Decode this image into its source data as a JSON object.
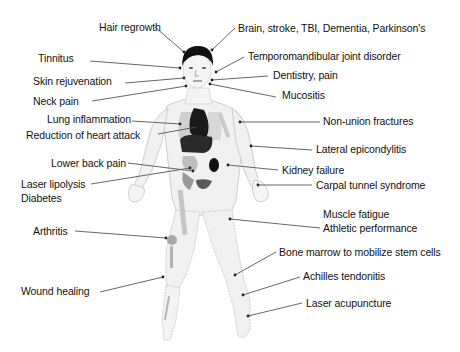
{
  "diagram": {
    "labels": [
      {
        "id": "hair-regrowth",
        "text": "Hair regrowth",
        "x": 99,
        "y": 21,
        "line": [
          155,
          27,
          184,
          52
        ]
      },
      {
        "id": "brain",
        "text": "Brain, stroke, TBI, Dementia, Parkinson's",
        "x": 238,
        "y": 22,
        "line": [
          235,
          28,
          212,
          50
        ]
      },
      {
        "id": "tinnitus",
        "text": "Tinnitus",
        "x": 38,
        "y": 52,
        "line": [
          90,
          61,
          180,
          68
        ]
      },
      {
        "id": "tmj",
        "text": "Temporomandibular joint disorder",
        "x": 248,
        "y": 50,
        "line": [
          244,
          57,
          216,
          72
        ]
      },
      {
        "id": "skin-rejuvenation",
        "text": "Skin rejuvenation",
        "x": 33,
        "y": 75,
        "line": [
          125,
          83,
          184,
          78
        ]
      },
      {
        "id": "dentistry",
        "text": "Dentistry, pain",
        "x": 273,
        "y": 69,
        "line": [
          268,
          76,
          212,
          80
        ]
      },
      {
        "id": "neck-pain",
        "text": "Neck pain",
        "x": 33,
        "y": 95,
        "line": [
          92,
          101,
          186,
          86
        ]
      },
      {
        "id": "mucositis",
        "text": "Mucositis",
        "x": 282,
        "y": 89,
        "line": [
          276,
          97,
          210,
          84
        ]
      },
      {
        "id": "lung-inflammation",
        "text": "Lung inflammation",
        "x": 47,
        "y": 113,
        "line": [
          132,
          121,
          180,
          124
        ]
      },
      {
        "id": "non-union-fractures",
        "text": "Non-union fractures",
        "x": 323,
        "y": 115,
        "line": [
          320,
          122,
          240,
          122
        ]
      },
      {
        "id": "heart-attack",
        "text": "Reduction of heart attack",
        "x": 26,
        "y": 129,
        "line": [
          158,
          134,
          197,
          127
        ]
      },
      {
        "id": "lateral-epicondylitis",
        "text": "Lateral epicondylitis",
        "x": 316,
        "y": 143,
        "line": [
          312,
          150,
          251,
          146
        ]
      },
      {
        "id": "lower-back-pain",
        "text": "Lower back pain",
        "x": 51,
        "y": 157,
        "line": [
          128,
          163,
          193,
          171
        ]
      },
      {
        "id": "kidney-failure",
        "text": "Kidney failure",
        "x": 282,
        "y": 164,
        "line": [
          278,
          170,
          228,
          165
        ]
      },
      {
        "id": "laser-lipolysis",
        "text": "Laser lipolysis",
        "x": 21,
        "y": 178,
        "line": [
          91,
          184,
          190,
          168
        ]
      },
      {
        "id": "carpal-tunnel",
        "text": "Carpal tunnel syndrome",
        "x": 316,
        "y": 179,
        "line": [
          312,
          185,
          258,
          185
        ]
      },
      {
        "id": "diabetes",
        "text": "Diabetes",
        "x": 21,
        "y": 192,
        "line": null
      },
      {
        "id": "muscle-fatigue",
        "text": "Muscle fatigue",
        "x": 323,
        "y": 208,
        "line": null
      },
      {
        "id": "athletic-performance",
        "text": "Athletic performance",
        "x": 323,
        "y": 222,
        "line": [
          320,
          228,
          230,
          219
        ]
      },
      {
        "id": "arthritis",
        "text": "Arthritis",
        "x": 33,
        "y": 225,
        "line": [
          75,
          231,
          166,
          238
        ]
      },
      {
        "id": "bone-marrow",
        "text": "Bone marrow to mobilize stem cells",
        "x": 279,
        "y": 246,
        "line": [
          276,
          252,
          235,
          275
        ]
      },
      {
        "id": "achilles",
        "text": "Achilles tendonitis",
        "x": 303,
        "y": 270,
        "line": [
          300,
          277,
          243,
          295
        ]
      },
      {
        "id": "wound-healing",
        "text": "Wound healing",
        "x": 21,
        "y": 285,
        "line": [
          100,
          292,
          163,
          277
        ]
      },
      {
        "id": "laser-acupuncture",
        "text": "Laser acupuncture",
        "x": 306,
        "y": 297,
        "line": [
          302,
          303,
          248,
          316
        ]
      }
    ],
    "colors": {
      "text": "#111111",
      "leader_line": "#555555",
      "skin_fill": "#f1f1f1",
      "skin_outline": "#b8b8b8",
      "hair": "#111111",
      "heart": "#1a1a1a",
      "liver": "#2a2a2a",
      "kidney": "#111111",
      "bladder": "#5a5a5a",
      "lung": "#cfcfcf",
      "bone": "#bdbdbd"
    }
  }
}
